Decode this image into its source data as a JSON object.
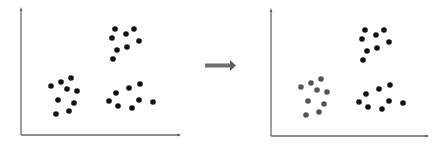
{
  "diagram": {
    "colors": {
      "axis": "#6a6a6a",
      "point": "#111111",
      "highlight_cluster": "#555555",
      "arrow": "#6f6f6f"
    },
    "panels": [
      {
        "name": "before",
        "clusters": [
          {
            "name": "cluster-top-right",
            "highlighted": false,
            "points": [
              [
                115,
                29
              ],
              [
                126,
                34
              ],
              [
                134,
                29
              ],
              [
                112,
                38
              ],
              [
                139,
                41
              ],
              [
                117,
                50
              ],
              [
                127,
                47
              ],
              [
                113,
                59
              ]
            ]
          },
          {
            "name": "cluster-bottom-left",
            "highlighted": false,
            "points": [
              [
                51,
                86
              ],
              [
                61,
                82
              ],
              [
                71,
                78
              ],
              [
                67,
                89
              ],
              [
                77,
                91
              ],
              [
                58,
                100
              ],
              [
                74,
                103
              ],
              [
                56,
                114
              ],
              [
                69,
                111
              ]
            ]
          },
          {
            "name": "cluster-bottom-right",
            "highlighted": false,
            "points": [
              [
                109,
                101
              ],
              [
                116,
                93
              ],
              [
                129,
                88
              ],
              [
                140,
                84
              ],
              [
                118,
                106
              ],
              [
                139,
                100
              ],
              [
                132,
                108
              ],
              [
                153,
                102
              ]
            ]
          }
        ]
      },
      {
        "name": "after",
        "clusters": [
          {
            "name": "cluster-top-right",
            "highlighted": false,
            "points": [
              [
                115,
                29
              ],
              [
                126,
                34
              ],
              [
                134,
                29
              ],
              [
                112,
                38
              ],
              [
                139,
                41
              ],
              [
                117,
                50
              ],
              [
                127,
                47
              ],
              [
                113,
                59
              ]
            ]
          },
          {
            "name": "cluster-bottom-left",
            "highlighted": true,
            "points": [
              [
                51,
                86
              ],
              [
                61,
                82
              ],
              [
                71,
                78
              ],
              [
                67,
                89
              ],
              [
                77,
                91
              ],
              [
                58,
                100
              ],
              [
                74,
                103
              ],
              [
                56,
                114
              ],
              [
                69,
                111
              ]
            ]
          },
          {
            "name": "cluster-bottom-right",
            "highlighted": false,
            "points": [
              [
                109,
                101
              ],
              [
                116,
                93
              ],
              [
                129,
                88
              ],
              [
                140,
                84
              ],
              [
                118,
                106
              ],
              [
                139,
                100
              ],
              [
                132,
                108
              ],
              [
                153,
                102
              ]
            ]
          }
        ]
      }
    ]
  }
}
